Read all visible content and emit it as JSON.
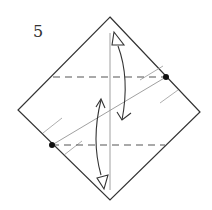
{
  "diagram": {
    "step_number": "5",
    "colors": {
      "outline": "#333333",
      "dashed": "#555555",
      "thin_line": "#888888",
      "dot": "#111111",
      "arrow": "#333333"
    },
    "square": {
      "top": [
        110,
        17
      ],
      "right": [
        200,
        112
      ],
      "bottom": [
        110,
        200
      ],
      "left": [
        18,
        110
      ]
    },
    "valley_folds": [
      {
        "x1": 53,
        "y1": 77,
        "x2": 166,
        "y2": 77
      },
      {
        "x1": 52,
        "y1": 145,
        "x2": 165,
        "y2": 145
      }
    ],
    "reference_points": [
      {
        "cx": 166,
        "cy": 77
      },
      {
        "cx": 52,
        "cy": 145
      }
    ]
  }
}
